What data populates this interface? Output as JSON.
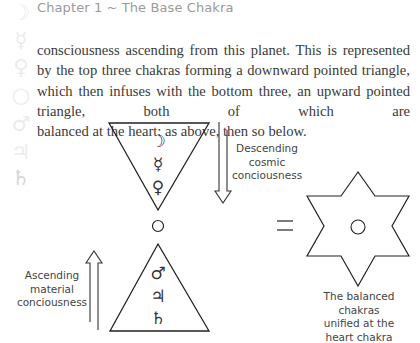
{
  "header": {
    "chapter_title": "Chapter 1 ~ The Base Chakra"
  },
  "sidebar": {
    "icons": [
      {
        "name": "moon-icon",
        "glyph": "☽"
      },
      {
        "name": "mercury-icon",
        "glyph": "☿"
      },
      {
        "name": "venus-icon",
        "glyph": "♀"
      },
      {
        "name": "sun-icon",
        "glyph": "○"
      },
      {
        "name": "mars-icon",
        "glyph": "♂"
      },
      {
        "name": "jupiter-icon",
        "glyph": "♃"
      },
      {
        "name": "saturn-icon",
        "glyph": "♄",
        "active": true
      }
    ]
  },
  "body": {
    "paragraph": "consciousness ascending from this planet. This is represented by the top three chakras forming a downward pointed triangle, which then infuses with the bottom three, an upward pointed triangle, both of which are",
    "last_line": "balanced at the heart: as above, then so below."
  },
  "diagram": {
    "upper_triangle_glyphs": [
      "☽",
      "☿",
      "♀"
    ],
    "heart_glyph": "○",
    "lower_triangle_glyphs": [
      "♂",
      "♃",
      "♄"
    ],
    "equals_symbol": "=",
    "descending_label": [
      "Descending",
      "cosmic",
      "conciousness"
    ],
    "ascending_label": [
      "Ascending",
      "material",
      "conciousness"
    ],
    "star_caption": [
      "The balanced chakras",
      "unified at the",
      "heart chakra"
    ]
  }
}
